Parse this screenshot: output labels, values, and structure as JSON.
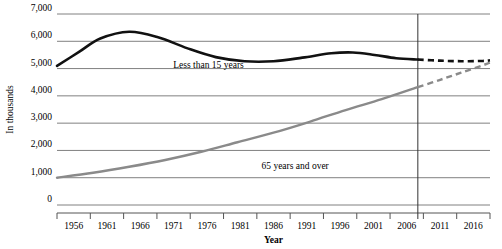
{
  "chart_data": {
    "type": "line",
    "title": "",
    "xlabel": "Year",
    "ylabel": "In thousands",
    "ylim": [
      0,
      7000
    ],
    "xlim": [
      1956,
      2016
    ],
    "grid": true,
    "legend_position": "inline-annotation",
    "y_ticks": [
      "0",
      "1,000",
      "2,000",
      "3,000",
      "4,000",
      "5,000",
      "6,000",
      "7,000"
    ],
    "y_tick_values": [
      0,
      1000,
      2000,
      3000,
      4000,
      5000,
      6000,
      7000
    ],
    "x_ticks": [
      "1956",
      "1961",
      "1966",
      "1971",
      "1976",
      "1981",
      "1986",
      "1991",
      "1996",
      "2001",
      "2006",
      "2011",
      "2016"
    ],
    "x_tick_values": [
      1956,
      1961,
      1966,
      1971,
      1976,
      1981,
      1986,
      1991,
      1996,
      2001,
      2006,
      2011,
      2016
    ],
    "projection_divider_year": 2006,
    "annotations": [
      {
        "text": "Less than 15 years",
        "x": 1977,
        "y": 5020
      },
      {
        "text": "65 years and over",
        "x": 1989,
        "y": 1320
      }
    ],
    "series": [
      {
        "name": "Less than 15 years",
        "color": "#111111",
        "actual_x": [
          1956,
          1959,
          1962,
          1966,
          1970,
          1974,
          1978,
          1982,
          1986,
          1990,
          1994,
          1997,
          2000,
          2003,
          2006
        ],
        "actual_values": [
          5100,
          5600,
          6100,
          6350,
          6150,
          5750,
          5420,
          5270,
          5270,
          5400,
          5560,
          5590,
          5500,
          5380,
          5330
        ],
        "projected_x": [
          2006,
          2009,
          2012,
          2015,
          2016
        ],
        "projected_values": [
          5330,
          5290,
          5270,
          5280,
          5300
        ]
      },
      {
        "name": "65 years and over",
        "color": "#8a8a8a",
        "actual_x": [
          1956,
          1961,
          1966,
          1971,
          1976,
          1981,
          1986,
          1991,
          1996,
          2001,
          2006
        ],
        "actual_values": [
          1000,
          1180,
          1400,
          1650,
          1950,
          2300,
          2650,
          3050,
          3480,
          3880,
          4320
        ],
        "projected_x": [
          2006,
          2009,
          2012,
          2015,
          2016
        ],
        "projected_values": [
          4320,
          4580,
          4850,
          5120,
          5220
        ]
      }
    ]
  }
}
